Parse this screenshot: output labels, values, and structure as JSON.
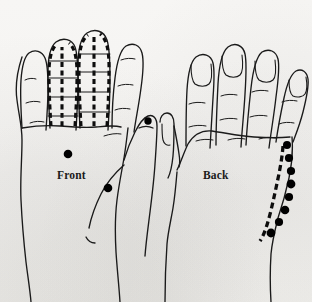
{
  "figure": {
    "background_color": "#f6f5f3",
    "ink_color": "#1a1a1a",
    "point_color": "#000000",
    "width": 312,
    "height": 302
  },
  "labels": {
    "front": "Front",
    "back": "Back"
  },
  "views": [
    {
      "name": "front",
      "label": "Front",
      "side": "left",
      "description": "Palmar (front) view of the hand with meridian lines marked along the index and middle fingers",
      "label_position": {
        "x": 57,
        "y": 169
      },
      "meridian_fingers": [
        "index",
        "middle"
      ],
      "plain_fingers": [
        "little",
        "ring",
        "thumb"
      ],
      "points": [
        {
          "id": "front-palm-center",
          "x": 68,
          "y": 154,
          "r": 4.2
        },
        {
          "id": "front-thenar",
          "x": 108,
          "y": 188,
          "r": 4.2
        },
        {
          "id": "front-thumb-tip",
          "x": 148,
          "y": 121,
          "r": 3.6
        }
      ],
      "point_count": 3
    },
    {
      "name": "back",
      "label": "Back",
      "side": "right",
      "description": "Dorsal (back) view of the hand with a dashed meridian and a chain of points along the ulnar border",
      "label_position": {
        "x": 203,
        "y": 169
      },
      "meridian_line": "dashed line along the ulnar border of the back of the hand",
      "fingernails_visible": true,
      "points": [
        {
          "id": "back-ulnar-1",
          "x": 286,
          "y": 145,
          "r": 4.0
        },
        {
          "id": "back-ulnar-2",
          "x": 288,
          "y": 158,
          "r": 4.0
        },
        {
          "id": "back-ulnar-3",
          "x": 290,
          "y": 171,
          "r": 4.0
        },
        {
          "id": "back-ulnar-4",
          "x": 291,
          "y": 184,
          "r": 4.2
        },
        {
          "id": "back-ulnar-5",
          "x": 289,
          "y": 197,
          "r": 4.0
        },
        {
          "id": "back-ulnar-6",
          "x": 285,
          "y": 210,
          "r": 4.2
        },
        {
          "id": "back-ulnar-7",
          "x": 280,
          "y": 222,
          "r": 4.0
        },
        {
          "id": "back-ulnar-8",
          "x": 272,
          "y": 233,
          "r": 4.2
        }
      ],
      "point_count": 8
    }
  ]
}
